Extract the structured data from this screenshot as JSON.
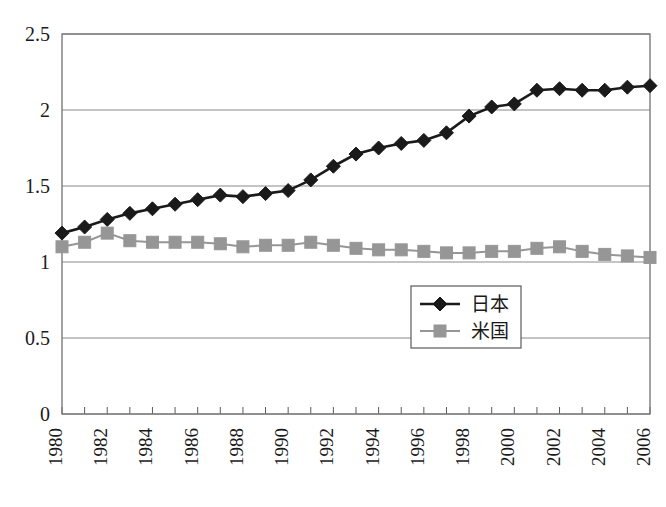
{
  "chart_data": {
    "type": "line",
    "title": "",
    "xlabel": "",
    "ylabel": "",
    "xlim": [
      1980,
      2006
    ],
    "ylim": [
      0,
      2.5
    ],
    "grid": true,
    "grid_axis": "y",
    "legend_position": "center-bottom-right",
    "x": [
      1980,
      1981,
      1982,
      1983,
      1984,
      1985,
      1986,
      1987,
      1988,
      1989,
      1990,
      1991,
      1992,
      1993,
      1994,
      1995,
      1996,
      1997,
      1998,
      1999,
      2000,
      2001,
      2002,
      2003,
      2004,
      2005,
      2006
    ],
    "xtick_labels": [
      "1980",
      "1982",
      "1984",
      "1986",
      "1988",
      "1990",
      "1992",
      "1994",
      "1996",
      "1998",
      "2000",
      "2002",
      "2004",
      "2006"
    ],
    "xtick_values": [
      1980,
      1982,
      1984,
      1986,
      1988,
      1990,
      1992,
      1994,
      1996,
      1998,
      2000,
      2002,
      2004,
      2006
    ],
    "ytick_labels": [
      "0",
      "0.5",
      "1",
      "1.5",
      "2",
      "2.5"
    ],
    "ytick_values": [
      0,
      0.5,
      1,
      1.5,
      2,
      2.5
    ],
    "series": [
      {
        "name": "日本",
        "color": "#1a1a1a",
        "marker": "diamond",
        "values": [
          1.19,
          1.23,
          1.28,
          1.32,
          1.35,
          1.38,
          1.41,
          1.44,
          1.43,
          1.45,
          1.47,
          1.54,
          1.63,
          1.71,
          1.75,
          1.78,
          1.8,
          1.85,
          1.96,
          2.02,
          2.04,
          2.13,
          2.14,
          2.13,
          2.13,
          2.15,
          2.16
        ]
      },
      {
        "name": "米国",
        "color": "#969696",
        "marker": "square",
        "values": [
          1.1,
          1.13,
          1.19,
          1.14,
          1.13,
          1.13,
          1.13,
          1.12,
          1.1,
          1.11,
          1.11,
          1.13,
          1.11,
          1.09,
          1.08,
          1.08,
          1.07,
          1.06,
          1.06,
          1.07,
          1.07,
          1.09,
          1.1,
          1.07,
          1.05,
          1.04,
          1.03
        ]
      }
    ]
  },
  "legend": {
    "items": [
      {
        "label": "日本",
        "marker": "diamond",
        "color": "#1a1a1a"
      },
      {
        "label": "米国",
        "marker": "square",
        "color": "#969696"
      }
    ]
  }
}
